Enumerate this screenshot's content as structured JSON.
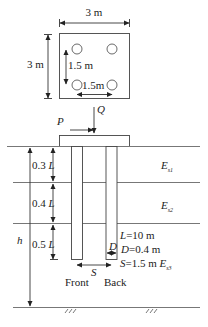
{
  "plan_view": {
    "width_label": "3 m",
    "height_label": "3 m",
    "vertical_spacing_label": "1.5 m",
    "horizontal_spacing_label": "1.5m",
    "pile_count": 4
  },
  "loads": {
    "horizontal": "P",
    "vertical": "Q"
  },
  "layers": [
    {
      "thickness_label": "0.3",
      "unit_symbol": "L",
      "modulus": "E",
      "modulus_sub": "s1"
    },
    {
      "thickness_label": "0.4",
      "unit_symbol": "L",
      "modulus": "E",
      "modulus_sub": "s2"
    },
    {
      "thickness_label": "0.5",
      "unit_symbol": "L",
      "modulus": "E",
      "modulus_sub": "s3"
    }
  ],
  "depth_label": "h",
  "diameter_symbol": "D",
  "spacing_symbol": "S",
  "parameters": {
    "L": {
      "symbol": "L",
      "value": "=10 m"
    },
    "D": {
      "symbol": "D",
      "value": "=0.4 m"
    },
    "S": {
      "symbol": "S",
      "value": "=1.5 m"
    }
  },
  "pile_labels": {
    "front": "Front",
    "back": "Back"
  }
}
